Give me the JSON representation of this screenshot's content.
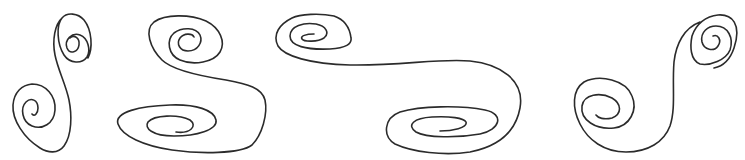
{
  "image": {
    "width": 745,
    "height": 160,
    "background": "#ffffff",
    "stroke_color": "#2b2b2b",
    "description": "Four hand-drawn double-spiral (S-shaped) line ornaments"
  },
  "shapes": [
    {
      "name": "spiral-ornament-1",
      "kind": "vertical S double spiral"
    },
    {
      "name": "spiral-ornament-2",
      "kind": "S double spiral"
    },
    {
      "name": "spiral-ornament-3",
      "kind": "elongated horizontal S double spiral"
    },
    {
      "name": "spiral-ornament-4",
      "kind": "reverse S double spiral"
    }
  ]
}
